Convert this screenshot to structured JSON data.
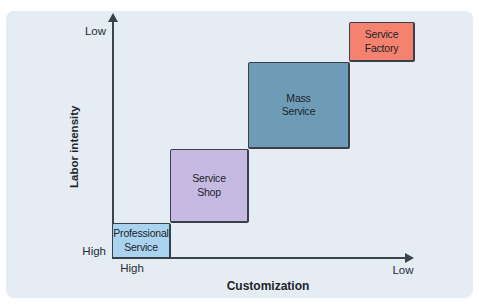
{
  "figure": {
    "background_color": "#e5ecf3",
    "axis_color": "#3a424b"
  },
  "chart_data": {
    "type": "matrix-step-diagram",
    "x_axis": {
      "label": "Customization",
      "left_end": "High",
      "right_end": "Low"
    },
    "y_axis": {
      "label": "Labor intensity",
      "top_end": "Low",
      "bottom_end": "High"
    },
    "boxes": [
      {
        "name": "Professional Service",
        "line1": "Professional",
        "line2": "Service",
        "color": "#aad3f0",
        "labor_intensity": "High",
        "customization": "High"
      },
      {
        "name": "Service Shop",
        "line1": "Service",
        "line2": "Shop",
        "color": "#c7bae2",
        "labor_intensity": "Medium-High",
        "customization": "Medium-High"
      },
      {
        "name": "Mass Service",
        "line1": "Mass",
        "line2": "Service",
        "color": "#6e9cb6",
        "labor_intensity": "Medium-Low",
        "customization": "Medium-Low"
      },
      {
        "name": "Service Factory",
        "line1": "Service",
        "line2": "Factory",
        "color": "#f5826f",
        "labor_intensity": "Low",
        "customization": "Low"
      }
    ]
  }
}
